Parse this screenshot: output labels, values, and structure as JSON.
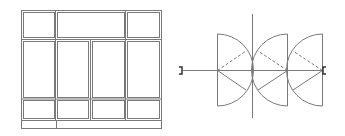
{
  "diagram": {
    "type": "architectural-drawing",
    "stroke_color": "#7a7a7a",
    "background": "#ffffff",
    "elevation": {
      "description": "window/door elevation with 3 rows of panes",
      "rows": [
        {
          "name": "transom",
          "panes": 3
        },
        {
          "name": "main",
          "panes": 4
        },
        {
          "name": "lower",
          "panes": 4
        },
        {
          "name": "base",
          "panes": 2
        }
      ]
    },
    "plan": {
      "description": "folding door plan with three swing arcs",
      "leaves": 3,
      "end_markers": 2
    }
  }
}
